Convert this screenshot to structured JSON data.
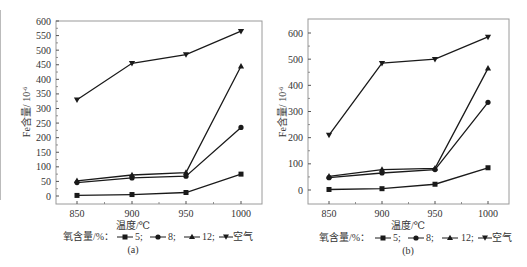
{
  "chart_data": [
    {
      "type": "line",
      "panel_label": "(a)",
      "xlabel": "温度/℃",
      "ylabel": "Fe含量/ 10^-6",
      "x": [
        850,
        900,
        950,
        1000
      ],
      "x_ticks": [
        "850",
        "900",
        "950",
        "1000"
      ],
      "y_ticks": [
        "0",
        "50",
        "100",
        "150",
        "200",
        "250",
        "300",
        "350",
        "400",
        "450",
        "500",
        "550",
        "600"
      ],
      "ylim": [
        -25,
        600
      ],
      "grid": false,
      "legend_title": "氧含量/%：",
      "legend_position": "bottom",
      "series": [
        {
          "name": "5",
          "marker": "square",
          "values": [
            2,
            5,
            12,
            75
          ]
        },
        {
          "name": "8",
          "marker": "circle",
          "values": [
            46,
            62,
            68,
            235
          ]
        },
        {
          "name": "12",
          "marker": "triangle-up",
          "values": [
            52,
            72,
            80,
            445
          ]
        },
        {
          "name": "空气",
          "marker": "triangle-down",
          "values": [
            330,
            455,
            485,
            565
          ]
        }
      ]
    },
    {
      "type": "line",
      "panel_label": "(b)",
      "xlabel": "温度/℃",
      "ylabel": "Fe含量/ 10^-6",
      "x": [
        850,
        900,
        950,
        1000
      ],
      "x_ticks": [
        "850",
        "900",
        "950",
        "1000"
      ],
      "y_ticks": [
        "0",
        "100",
        "200",
        "300",
        "400",
        "500",
        "600"
      ],
      "ylim": [
        -50,
        650
      ],
      "grid": false,
      "legend_title": "氧含量/%：",
      "legend_position": "bottom",
      "series": [
        {
          "name": "5",
          "marker": "square",
          "values": [
            2,
            5,
            22,
            85
          ]
        },
        {
          "name": "8",
          "marker": "circle",
          "values": [
            47,
            65,
            78,
            335
          ]
        },
        {
          "name": "12",
          "marker": "triangle-up",
          "values": [
            52,
            78,
            83,
            465
          ]
        },
        {
          "name": "空气",
          "marker": "triangle-down",
          "values": [
            210,
            485,
            500,
            585
          ]
        }
      ]
    }
  ],
  "panels": {
    "a": {
      "label": "(a)",
      "xlabel": "温度/℃",
      "ylabel_main": "Fe含量/ 10",
      "ylabel_exp": "-6",
      "legend_title": "氧含量/%：",
      "legend_items": [
        "5;",
        "8;",
        "12;",
        "空气"
      ]
    },
    "b": {
      "label": "(b)",
      "xlabel": "温度/℃",
      "ylabel_main": "Fe含量/ 10",
      "ylabel_exp": "-6",
      "legend_title": "氧含量/%：",
      "legend_items": [
        "5;",
        "8;",
        "12;",
        "空气"
      ]
    }
  },
  "colors": {
    "line": "#1a1a1a",
    "frame": "#9a9a9a",
    "text": "#333333"
  }
}
